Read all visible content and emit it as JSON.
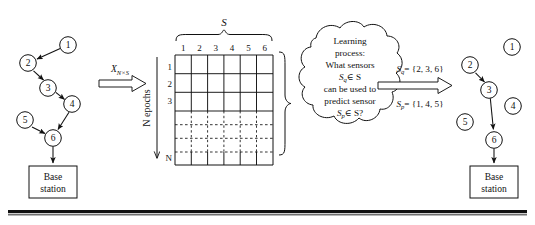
{
  "figure": {
    "background": "#ffffff",
    "stroke": "#111111",
    "rule_color": "#111111"
  },
  "left_network": {
    "title": "sensor-network-before",
    "nodes": [
      {
        "id": "1",
        "label": "1",
        "cx": 68,
        "cy": 45
      },
      {
        "id": "2",
        "label": "2",
        "cx": 28,
        "cy": 63
      },
      {
        "id": "3",
        "label": "3",
        "cx": 48,
        "cy": 88
      },
      {
        "id": "4",
        "label": "4",
        "cx": 72,
        "cy": 104
      },
      {
        "id": "5",
        "label": "5",
        "cx": 25,
        "cy": 120
      },
      {
        "id": "6",
        "label": "6",
        "cx": 53,
        "cy": 138
      }
    ],
    "edges": [
      {
        "from": "1",
        "to": "2"
      },
      {
        "from": "2",
        "to": "3"
      },
      {
        "from": "3",
        "to": "4"
      },
      {
        "from": "4",
        "to": "6"
      },
      {
        "from": "5",
        "to": "6"
      }
    ],
    "base_station": {
      "line1": "Base",
      "line2": "station",
      "x": 29,
      "y": 166,
      "w": 48,
      "h": 32
    }
  },
  "transform_arrow_left": {
    "label_main": "X",
    "label_sub": "N×S",
    "label_full": "X N×S"
  },
  "matrix": {
    "top_brace_label": "S",
    "side_axis_label": "N epochs",
    "column_headers": [
      "1",
      "2",
      "3",
      "4",
      "5",
      "6"
    ],
    "row_headers_solid_top": [
      "1",
      "2",
      "3"
    ],
    "row_header_bottom": "N",
    "dashed_row_count": 3,
    "x": 175,
    "y": 55,
    "w": 98,
    "h": 110
  },
  "cloud": {
    "lines": [
      "Learning",
      "process:",
      "What sensors",
      "Sₑ ∈ S",
      "can be used to",
      "predict sensor",
      "Sₚ ∈ S?"
    ],
    "line1": "Learning",
    "line2": "process:",
    "line3": "What sensors",
    "line4_main": "S",
    "line4_sub": "q",
    "line4_rest": "∈ S",
    "line5": "can be used to",
    "line6": "predict sensor",
    "line7_main": "S",
    "line7_sub": "p",
    "line7_rest": "∈ S?"
  },
  "result_arrow": {
    "eq_top_main": "S",
    "eq_top_sub": "q",
    "eq_top_rest": "= {2, 3, 6}",
    "eq_top_full": "S q = {2, 3, 6}",
    "eq_bottom_main": "S",
    "eq_bottom_sub": "p",
    "eq_bottom_rest": "= {1, 4, 5}",
    "eq_bottom_full": "S p = {1, 4, 5}"
  },
  "right_network": {
    "title": "sensor-network-after",
    "nodes": [
      {
        "id": "1",
        "label": "1",
        "cx": 512,
        "cy": 47
      },
      {
        "id": "2",
        "label": "2",
        "cx": 470,
        "cy": 65
      },
      {
        "id": "3",
        "label": "3",
        "cx": 489,
        "cy": 90
      },
      {
        "id": "4",
        "label": "4",
        "cx": 513,
        "cy": 106
      },
      {
        "id": "5",
        "label": "5",
        "cx": 465,
        "cy": 122
      },
      {
        "id": "6",
        "label": "6",
        "cx": 494,
        "cy": 140
      }
    ],
    "edges": [
      {
        "from": "2",
        "to": "3"
      },
      {
        "from": "3",
        "to": "6"
      }
    ],
    "base_station": {
      "line1": "Base",
      "line2": "station",
      "x": 470,
      "y": 166,
      "w": 48,
      "h": 32
    }
  },
  "bottom_rule": {
    "present": true
  }
}
